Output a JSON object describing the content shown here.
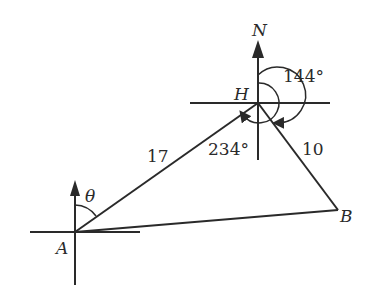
{
  "diagram": {
    "points": {
      "A": {
        "label": "A",
        "x": 75,
        "y": 232
      },
      "H": {
        "label": "H",
        "x": 258,
        "y": 103
      },
      "B": {
        "label": "B",
        "x": 338,
        "y": 210
      }
    },
    "north_label": "N",
    "edges": [
      {
        "from": "A",
        "to": "H",
        "label": "17"
      },
      {
        "from": "H",
        "to": "B",
        "label": "10"
      },
      {
        "from": "A",
        "to": "B",
        "label": ""
      }
    ],
    "angles": [
      {
        "at": "H",
        "label": "144°",
        "description": "bearing of B from H"
      },
      {
        "at": "H",
        "label": "234°",
        "description": "bearing of A from H"
      },
      {
        "at": "A",
        "label": "θ",
        "description": "bearing of H from A"
      }
    ],
    "colors": {
      "stroke": "#2a2a2a",
      "background": "#ffffff"
    }
  }
}
